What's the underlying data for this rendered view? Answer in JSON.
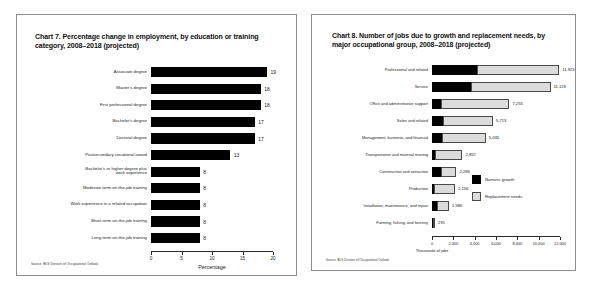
{
  "page": {
    "background": "#ffffff",
    "panel_border": "#8d8d8d"
  },
  "left_panel": {
    "title": "Chart 7. Percentage change in employment, by education or training category, 2008–2018 (projected)",
    "source": "Source: BLS Division of Occupational Outlook"
  },
  "right_panel": {
    "title": "Chart 8. Number of jobs due to growth and replacement needs, by major occupational group, 2008–2018 (projected)",
    "source": "Source: BLS Division of Occupational Outlook"
  },
  "chart_data": [
    {
      "id": "chart7",
      "type": "bar",
      "orientation": "horizontal",
      "title": "Chart 7. Percentage change in employment, by education or training category, 2008–2018 (projected)",
      "xlabel": "Percentage",
      "ylabel": "",
      "xlim": [
        0,
        20
      ],
      "xticks": [
        0,
        5,
        10,
        15,
        20
      ],
      "xticklabels": [
        "0",
        "5",
        "10",
        "15",
        "20"
      ],
      "grid": false,
      "legend": null,
      "bar_color": "#000000",
      "categories": [
        "Associate degree",
        "Master's degree",
        "First professional degree",
        "Bachelor's degree",
        "Doctoral degree",
        "Postsecondary vocational award",
        "Bachelor's or higher degree plus\nwork experience",
        "Moderate-term on-the-job training",
        "Work experience in a related occupation",
        "Short-term on-the-job training",
        "Long-term on-the-job training"
      ],
      "values": [
        19,
        18,
        18,
        17,
        17,
        13,
        8,
        8,
        8,
        8,
        8
      ],
      "data_labels": [
        "19",
        "18",
        "18",
        "17",
        "17",
        "13",
        "8",
        "8",
        "8",
        "8",
        "8"
      ],
      "source": "Source: BLS Division of Occupational Outlook"
    },
    {
      "id": "chart8",
      "type": "bar",
      "orientation": "horizontal",
      "stacked": true,
      "title": "Chart 8. Number of jobs due to growth and replacement needs, by major occupational group, 2008–2018 (projected)",
      "xlabel": "Thousands of jobs",
      "ylabel": "",
      "xlim": [
        0,
        12000
      ],
      "xticks": [
        0,
        2000,
        4000,
        6000,
        8000,
        10000,
        12000
      ],
      "xticklabels": [
        "0",
        "2,000",
        "4,000",
        "6,000",
        "8,000",
        "10,000",
        "12,000"
      ],
      "grid": false,
      "legend_position": "center-right",
      "legend": [
        {
          "name": "Numeric growth",
          "color": "#000000"
        },
        {
          "name": "Replacement needs",
          "color": "#dcdcdc"
        }
      ],
      "categories": [
        "Professional and related",
        "Service",
        "Office and administrative support",
        "Sales and related",
        "Management, business, and financial",
        "Transportation and material moving",
        "Construction and extraction",
        "Production",
        "Installation, maintenance, and repair",
        "Farming, fishing, and forestry"
      ],
      "series": [
        {
          "name": "Numeric growth",
          "values": [
            4240,
            3610,
            810,
            1020,
            900,
            310,
            870,
            180,
            480,
            70
          ]
        },
        {
          "name": "Replacement needs",
          "values": [
            7683,
            7508,
            6445,
            4693,
            4135,
            2547,
            1416,
            1976,
            1106,
            221
          ]
        }
      ],
      "totals": [
        11923,
        11118,
        7255,
        5713,
        5035,
        2857,
        2286,
        2156,
        1586,
        291
      ],
      "data_labels": [
        "11,923",
        "11,118",
        "7,255",
        "5,713",
        "5,035",
        "2,857",
        "2,286",
        "2,156",
        "1,586",
        "291"
      ],
      "source": "Source: BLS Division of Occupational Outlook"
    }
  ]
}
